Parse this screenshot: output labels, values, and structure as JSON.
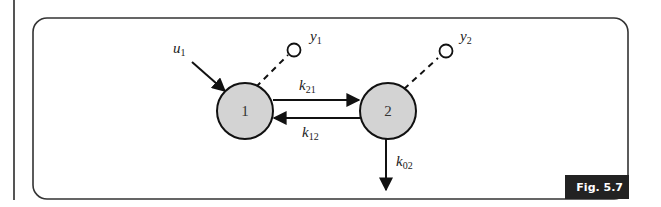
{
  "figure": {
    "label": "Fig. 5.7",
    "compartments": [
      {
        "id": "1",
        "label": "1"
      },
      {
        "id": "2",
        "label": "2"
      }
    ],
    "inputs": [
      {
        "name": "u",
        "sub": "1"
      }
    ],
    "outputs": [
      {
        "name": "y",
        "sub": "1"
      },
      {
        "name": "y",
        "sub": "2"
      }
    ],
    "rates": [
      {
        "name": "k",
        "sub": "21"
      },
      {
        "name": "k",
        "sub": "12"
      },
      {
        "name": "k",
        "sub": "02"
      }
    ],
    "colors": {
      "compartment_fill": "#d3d3d3",
      "stroke": "#1a1a1a",
      "badge": "#222222"
    }
  }
}
